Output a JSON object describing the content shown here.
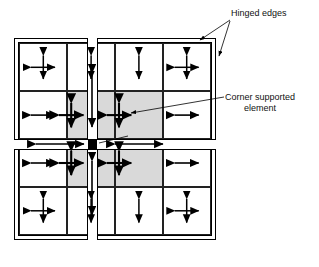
{
  "figure": {
    "type": "engineering-diagram"
  },
  "annotations": {
    "hinged_edges": {
      "label": "Hinged edges",
      "leader_targets": [
        "top-edge",
        "right-edge"
      ]
    },
    "corner_supported": {
      "label_line1": "Corner supported",
      "label_line2": "element",
      "leader_target": "shaded-element-r2c3"
    },
    "column": {
      "label": "Column",
      "leader_target": "central-column-square"
    }
  },
  "slab": {
    "rows": 4,
    "columns": 4,
    "outer_border_style": "double-line-hinged",
    "shading_color": "#d9d9d9",
    "column_color": "#000000",
    "strip_fill": "#ffffff",
    "elements": [
      {
        "row": 1,
        "col": 1,
        "shaded": false,
        "arrow": "cross"
      },
      {
        "row": 1,
        "col": 2,
        "shaded": false,
        "arrow": "vertical"
      },
      {
        "row": 1,
        "col": 3,
        "shaded": false,
        "arrow": "vertical"
      },
      {
        "row": 1,
        "col": 4,
        "shaded": false,
        "arrow": "cross"
      },
      {
        "row": 2,
        "col": 1,
        "shaded": false,
        "arrow": "horizontal"
      },
      {
        "row": 2,
        "col": 2,
        "shaded": true,
        "arrow": "cross-bold"
      },
      {
        "row": 2,
        "col": 3,
        "shaded": true,
        "arrow": "cross-bold"
      },
      {
        "row": 2,
        "col": 4,
        "shaded": false,
        "arrow": "horizontal"
      },
      {
        "row": 3,
        "col": 1,
        "shaded": false,
        "arrow": "horizontal"
      },
      {
        "row": 3,
        "col": 2,
        "shaded": true,
        "arrow": "cross-bold"
      },
      {
        "row": 3,
        "col": 3,
        "shaded": true,
        "arrow": "cross-bold"
      },
      {
        "row": 3,
        "col": 4,
        "shaded": false,
        "arrow": "horizontal"
      },
      {
        "row": 4,
        "col": 1,
        "shaded": false,
        "arrow": "cross"
      },
      {
        "row": 4,
        "col": 2,
        "shaded": false,
        "arrow": "vertical"
      },
      {
        "row": 4,
        "col": 3,
        "shaded": false,
        "arrow": "vertical"
      },
      {
        "row": 4,
        "col": 4,
        "shaded": false,
        "arrow": "cross"
      }
    ],
    "strips": {
      "vertical": {
        "arrows": [
          "up-down-above-column",
          "up-down-below-column"
        ]
      },
      "horizontal": {
        "arrows": [
          "left-right-left-of-column",
          "left-right-right-of-column"
        ]
      }
    }
  }
}
